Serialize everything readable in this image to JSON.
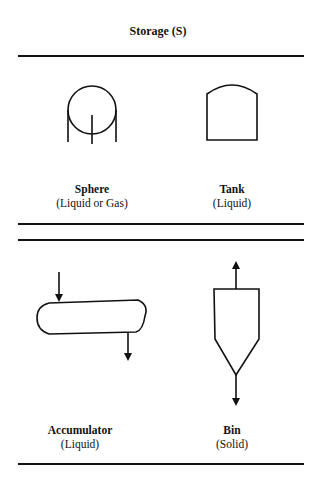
{
  "title": "Storage (S)",
  "symbols": [
    {
      "name": "Sphere",
      "phase": "(Liquid or Gas)"
    },
    {
      "name": "Tank",
      "phase": "(Liquid)"
    },
    {
      "name": "Accumulator",
      "phase": "(Liquid)"
    },
    {
      "name": "Bin",
      "phase": "(Solid)"
    }
  ],
  "colors": {
    "line": "#111111",
    "background": "#ffffff"
  }
}
